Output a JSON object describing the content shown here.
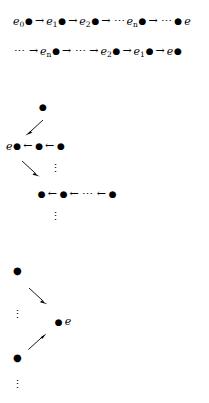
{
  "diagram": {
    "glyphs": {
      "bullet": "●",
      "arrow_right": "→",
      "arrow_left": "←",
      "hdots": "⋯",
      "vdots": "⋮",
      "e": "e"
    },
    "colors": {
      "ink": "#000000",
      "background": "#ffffff"
    },
    "rows": [
      {
        "name": "forward-chain-row",
        "tokens": [
          {
            "kind": "label",
            "base": "e",
            "sub": "0",
            "bullet": true
          },
          {
            "kind": "arrow",
            "text": "→"
          },
          {
            "kind": "label",
            "base": "e",
            "sub": "1",
            "bullet": true
          },
          {
            "kind": "arrow",
            "text": "→"
          },
          {
            "kind": "label",
            "base": "e",
            "sub": "2",
            "bullet": true
          },
          {
            "kind": "arrow",
            "text": "→"
          },
          {
            "kind": "hdots",
            "text": "⋯"
          },
          {
            "kind": "label",
            "base": "e",
            "sub": "n",
            "bullet": true
          },
          {
            "kind": "arrow",
            "text": "→"
          },
          {
            "kind": "hdots",
            "text": "⋯"
          },
          {
            "kind": "bullet",
            "text": "●"
          },
          {
            "kind": "label",
            "base": "e",
            "sub": "",
            "bullet": false
          }
        ]
      },
      {
        "name": "backward-chain-row",
        "tokens": [
          {
            "kind": "hdots",
            "text": "⋯"
          },
          {
            "kind": "arrow",
            "text": "→"
          },
          {
            "kind": "label",
            "base": "e",
            "sub": "n",
            "bullet": true
          },
          {
            "kind": "arrow",
            "text": "→"
          },
          {
            "kind": "hdots",
            "text": "⋯"
          },
          {
            "kind": "arrow",
            "text": "→"
          },
          {
            "kind": "label",
            "base": "e",
            "sub": "2",
            "bullet": true
          },
          {
            "kind": "arrow",
            "text": "→"
          },
          {
            "kind": "label",
            "base": "e",
            "sub": "1",
            "bullet": true
          },
          {
            "kind": "arrow",
            "text": "→"
          },
          {
            "kind": "label",
            "base": "e",
            "sub": "",
            "bullet": true
          }
        ]
      },
      {
        "name": "upper-left-chain-row",
        "tokens": [
          {
            "kind": "label",
            "base": "e",
            "sub": "",
            "bullet": true
          },
          {
            "kind": "arrow",
            "text": "←"
          },
          {
            "kind": "bullet",
            "text": "●"
          },
          {
            "kind": "arrow",
            "text": "←"
          },
          {
            "kind": "bullet",
            "text": "●"
          }
        ]
      },
      {
        "name": "lower-indented-chain-row",
        "tokens": [
          {
            "kind": "bullet",
            "text": "●"
          },
          {
            "kind": "arrow",
            "text": "←"
          },
          {
            "kind": "bullet",
            "text": "●"
          },
          {
            "kind": "arrow",
            "text": "←"
          },
          {
            "kind": "hdots",
            "text": "⋯"
          },
          {
            "kind": "arrow",
            "text": "←"
          },
          {
            "kind": "bullet",
            "text": "●"
          }
        ]
      },
      {
        "name": "bottom-terminal-row",
        "tokens": [
          {
            "kind": "bullet",
            "text": "●"
          },
          {
            "kind": "gap"
          },
          {
            "kind": "label",
            "base": "e",
            "sub": "",
            "bullet": false
          }
        ]
      }
    ],
    "isolated_dots": [
      {
        "name": "apex-dot-upper-block",
        "text": "●"
      },
      {
        "name": "apex-dot-lower-block",
        "text": "●"
      },
      {
        "name": "anchor-dot-lower-block",
        "text": "●"
      }
    ],
    "ellipses": [
      {
        "name": "vdots-upper-block",
        "text": "⋮"
      },
      {
        "name": "vdots-mid-block",
        "text": "⋮"
      },
      {
        "name": "vdots-lower-left-upper",
        "text": "⋮"
      },
      {
        "name": "vdots-lower-left-bottom",
        "text": "⋮"
      }
    ],
    "diagonal_arrows": [
      {
        "name": "diagonal-arrow-southwest-upper",
        "direction": "southwest"
      },
      {
        "name": "diagonal-arrow-southeast-upper",
        "direction": "southeast"
      },
      {
        "name": "diagonal-arrow-southeast-lower",
        "direction": "southeast"
      },
      {
        "name": "diagonal-arrow-northeast-lower",
        "direction": "northeast"
      }
    ]
  }
}
